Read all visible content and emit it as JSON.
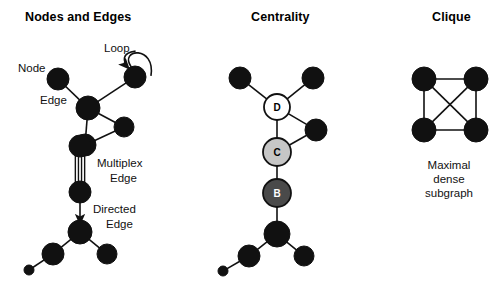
{
  "figure": {
    "background_color": "#ffffff",
    "node_color": "#111111",
    "edge_color": "#111111"
  },
  "panels": [
    {
      "id": "nodes-and-edges",
      "title": "Nodes and Edges",
      "title_x": 25,
      "title_y": 10,
      "labels": [
        {
          "id": "node",
          "text": "Node",
          "x": 18,
          "y": 62
        },
        {
          "id": "edge",
          "text": "Edge",
          "x": 40,
          "y": 94
        },
        {
          "id": "loop",
          "text": "Loop",
          "x": 104,
          "y": 42
        },
        {
          "id": "multiplex",
          "text": "Multiplex",
          "x": 97,
          "y": 157
        },
        {
          "id": "multiplex2",
          "text": "Edge",
          "x": 110,
          "y": 172
        },
        {
          "id": "directed",
          "text": "Directed",
          "x": 93,
          "y": 203
        },
        {
          "id": "directed2",
          "text": "Edge",
          "x": 106,
          "y": 218
        }
      ],
      "graph": {
        "nodes": [
          {
            "id": "n_topleft",
            "x": 58,
            "y": 79,
            "r": 11,
            "style": "black",
            "label": ""
          },
          {
            "id": "n_loop",
            "x": 135,
            "y": 77,
            "r": 11,
            "style": "black",
            "label": ""
          },
          {
            "id": "n_hub",
            "x": 88,
            "y": 108,
            "r": 12,
            "style": "black",
            "label": ""
          },
          {
            "id": "n_right",
            "x": 124,
            "y": 127,
            "r": 10,
            "style": "black",
            "label": ""
          },
          {
            "id": "n_lower",
            "x": 85,
            "y": 145,
            "r": 11,
            "style": "black",
            "label": ""
          },
          {
            "id": "n_mux_top",
            "x": 80,
            "y": 146,
            "r": 11,
            "style": "black",
            "label": ""
          },
          {
            "id": "n_mux_bottom",
            "x": 80,
            "y": 192,
            "r": 11,
            "style": "black",
            "label": ""
          },
          {
            "id": "n_dir_target",
            "x": 80,
            "y": 232,
            "r": 12,
            "style": "black",
            "label": ""
          },
          {
            "id": "n_bl",
            "x": 53,
            "y": 254,
            "r": 11,
            "style": "black",
            "label": ""
          },
          {
            "id": "n_br",
            "x": 107,
            "y": 254,
            "r": 10,
            "style": "black",
            "label": ""
          },
          {
            "id": "n_tiny",
            "x": 29,
            "y": 270,
            "r": 5,
            "style": "black",
            "label": ""
          }
        ],
        "edges": [
          {
            "from": "n_topleft",
            "to": "n_hub",
            "type": "plain"
          },
          {
            "from": "n_loop",
            "to": "n_hub",
            "type": "plain"
          },
          {
            "from": "n_hub",
            "to": "n_right",
            "type": "plain"
          },
          {
            "from": "n_hub",
            "to": "n_lower",
            "type": "plain"
          },
          {
            "from": "n_lower",
            "to": "n_right",
            "type": "plain"
          },
          {
            "from": "n_mux_top",
            "to": "n_mux_bottom",
            "type": "multiplex",
            "strands": 4
          },
          {
            "from": "n_mux_bottom",
            "to": "n_dir_target",
            "type": "directed"
          },
          {
            "from": "n_dir_target",
            "to": "n_bl",
            "type": "plain"
          },
          {
            "from": "n_dir_target",
            "to": "n_br",
            "type": "plain"
          },
          {
            "from": "n_bl",
            "to": "n_tiny",
            "type": "plain"
          },
          {
            "from": "n_loop",
            "to": "n_loop",
            "type": "loop"
          }
        ]
      }
    },
    {
      "id": "centrality",
      "title": "Centrality",
      "title_x": 251,
      "title_y": 10,
      "labels": [],
      "graph": {
        "nodes": [
          {
            "id": "c_topleft",
            "x": 240,
            "y": 78,
            "r": 11,
            "style": "black",
            "label": ""
          },
          {
            "id": "c_topright",
            "x": 313,
            "y": 78,
            "r": 11,
            "style": "black",
            "label": ""
          },
          {
            "id": "c_d",
            "x": 277,
            "y": 107,
            "r": 13,
            "style": "white",
            "label": "D"
          },
          {
            "id": "c_right",
            "x": 316,
            "y": 130,
            "r": 11,
            "style": "black",
            "label": ""
          },
          {
            "id": "c_c",
            "x": 277,
            "y": 152,
            "r": 14,
            "style": "lightgray",
            "label": "C"
          },
          {
            "id": "c_b",
            "x": 277,
            "y": 193,
            "r": 14,
            "style": "darkgray",
            "label": "B"
          },
          {
            "id": "c_hub",
            "x": 277,
            "y": 234,
            "r": 13,
            "style": "black",
            "label": ""
          },
          {
            "id": "c_bl",
            "x": 249,
            "y": 256,
            "r": 11,
            "style": "black",
            "label": ""
          },
          {
            "id": "c_br",
            "x": 304,
            "y": 256,
            "r": 10,
            "style": "black",
            "label": ""
          },
          {
            "id": "c_tiny",
            "x": 223,
            "y": 271,
            "r": 5,
            "style": "black",
            "label": ""
          }
        ],
        "edges": [
          {
            "from": "c_topleft",
            "to": "c_d",
            "type": "plain"
          },
          {
            "from": "c_topright",
            "to": "c_d",
            "type": "plain"
          },
          {
            "from": "c_d",
            "to": "c_right",
            "type": "plain"
          },
          {
            "from": "c_d",
            "to": "c_c",
            "type": "plain"
          },
          {
            "from": "c_c",
            "to": "c_right",
            "type": "plain"
          },
          {
            "from": "c_c",
            "to": "c_b",
            "type": "plain"
          },
          {
            "from": "c_b",
            "to": "c_hub",
            "type": "plain"
          },
          {
            "from": "c_hub",
            "to": "c_bl",
            "type": "plain"
          },
          {
            "from": "c_hub",
            "to": "c_br",
            "type": "plain"
          },
          {
            "from": "c_bl",
            "to": "c_tiny",
            "type": "plain"
          }
        ]
      }
    },
    {
      "id": "clique",
      "title": "Clique",
      "title_x": 432,
      "title_y": 10,
      "labels": [],
      "caption": {
        "lines": [
          "Maximal",
          "dense",
          "subgraph"
        ],
        "x": 449,
        "y": 158
      },
      "graph": {
        "nodes": [
          {
            "id": "q_tl",
            "x": 424,
            "y": 79,
            "r": 12,
            "style": "black",
            "label": ""
          },
          {
            "id": "q_tr",
            "x": 476,
            "y": 79,
            "r": 12,
            "style": "black",
            "label": ""
          },
          {
            "id": "q_bl",
            "x": 424,
            "y": 130,
            "r": 12,
            "style": "black",
            "label": ""
          },
          {
            "id": "q_br",
            "x": 476,
            "y": 130,
            "r": 12,
            "style": "black",
            "label": ""
          }
        ],
        "edges": [
          {
            "from": "q_tl",
            "to": "q_tr",
            "type": "plain"
          },
          {
            "from": "q_tl",
            "to": "q_bl",
            "type": "plain"
          },
          {
            "from": "q_tr",
            "to": "q_br",
            "type": "plain"
          },
          {
            "from": "q_bl",
            "to": "q_br",
            "type": "plain"
          },
          {
            "from": "q_tl",
            "to": "q_br",
            "type": "plain"
          },
          {
            "from": "q_tr",
            "to": "q_bl",
            "type": "plain"
          }
        ]
      }
    }
  ]
}
